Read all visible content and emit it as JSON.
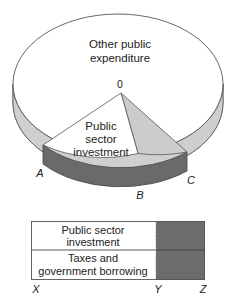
{
  "pie": {
    "center_label": "0",
    "segments": {
      "other": {
        "line1": "Other public",
        "line2": "expenditure"
      },
      "investment": {
        "line1": "Public",
        "line2": "sector",
        "line3": "investment"
      }
    },
    "points": {
      "a": "A",
      "b": "B",
      "c": "C"
    }
  },
  "bar": {
    "rows": [
      {
        "line1": "Public sector",
        "line2": "investment"
      },
      {
        "line1": "Taxes and",
        "line2": "government borrowing"
      }
    ],
    "axis": {
      "x": "X",
      "y": "Y",
      "z": "Z"
    }
  },
  "colors": {
    "rim_light": "#cfcfcf",
    "rim_dark": "#6a6a6a",
    "wedge_light": "#cccccc",
    "bar_dark": "#6c6c6c",
    "line": "#444444",
    "background": "#ffffff"
  }
}
